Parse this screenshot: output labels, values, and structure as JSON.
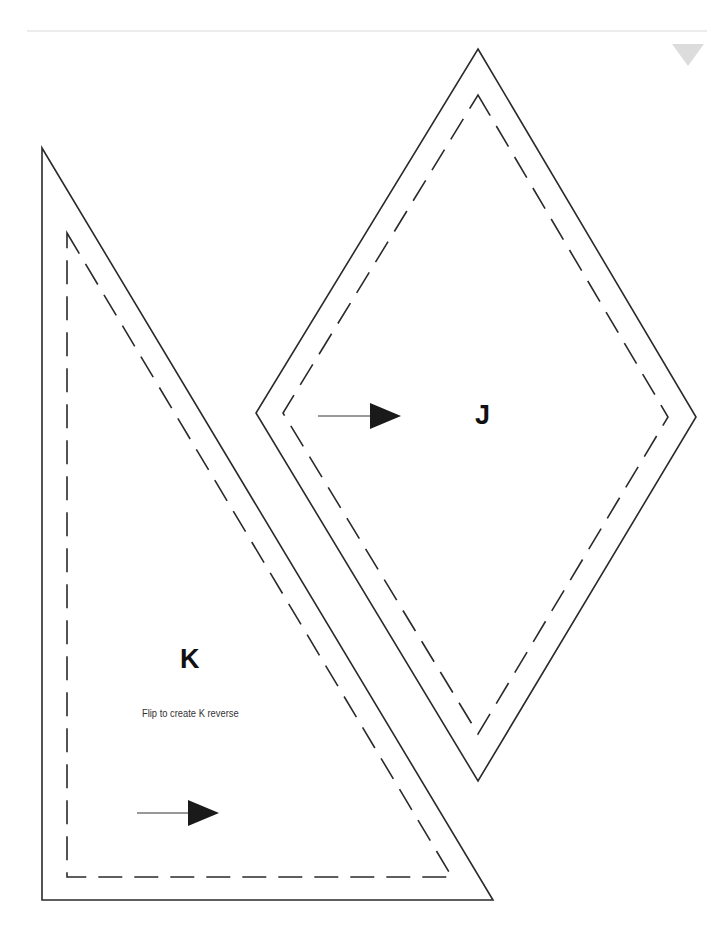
{
  "page": {
    "colors": {
      "stroke": "#2a2a2a",
      "header_rule": "#ececec",
      "corner_mark": "#dcdcdc",
      "arrow_fill": "#1a1a1a"
    }
  },
  "pieces": [
    {
      "id": "J",
      "label": "J",
      "shape": "diamond",
      "outer": [
        [
          478,
          49
        ],
        [
          696,
          417
        ],
        [
          478,
          781
        ],
        [
          256,
          413
        ]
      ],
      "inner": [
        [
          478,
          95
        ],
        [
          668,
          417
        ],
        [
          478,
          734
        ],
        [
          283,
          413
        ]
      ],
      "grain_arrow": {
        "x1": 318,
        "y1": 416,
        "x2": 400,
        "y2": 416
      }
    },
    {
      "id": "K",
      "label": "K",
      "note": "Flip to create K reverse",
      "shape": "triangle",
      "outer": [
        [
          42,
          148
        ],
        [
          493,
          900
        ],
        [
          42,
          900
        ]
      ],
      "inner": [
        [
          67,
          233
        ],
        [
          452,
          877
        ],
        [
          67,
          877
        ]
      ],
      "grain_arrow": {
        "x1": 137,
        "y1": 813,
        "x2": 218,
        "y2": 813
      }
    }
  ]
}
